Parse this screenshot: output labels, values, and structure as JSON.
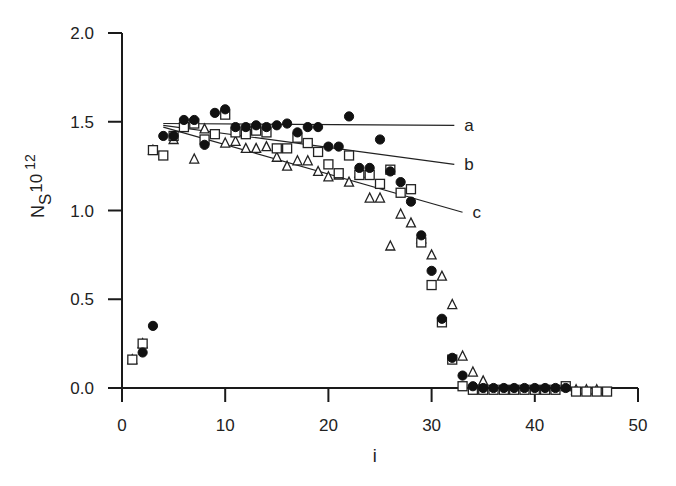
{
  "chart_data": {
    "type": "scatter",
    "title": "",
    "xlabel": "i",
    "ylabel": "N_S 10^12",
    "ylabel_parts": {
      "main": "N",
      "sub": "S",
      "mult": "10",
      "exp": "12"
    },
    "xlim": [
      0,
      50
    ],
    "ylim": [
      0.0,
      2.0
    ],
    "x_ticks": [
      0,
      10,
      20,
      30,
      40,
      50
    ],
    "x_tick_labels": [
      "0",
      "10",
      "20",
      "30",
      "40",
      "50"
    ],
    "y_ticks": [
      0.0,
      0.5,
      1.0,
      1.5,
      2.0
    ],
    "y_tick_labels": [
      "0.0",
      "0.5",
      "1.0",
      "1.5",
      "2.0"
    ],
    "grid": false,
    "legend": null,
    "series": [
      {
        "name": "filled circles",
        "marker": "circle-filled",
        "x": [
          2,
          3,
          4,
          5,
          6,
          7,
          8,
          9,
          10,
          11,
          12,
          13,
          14,
          15,
          16,
          17,
          18,
          19,
          20,
          21,
          22,
          23,
          24,
          25,
          26,
          27,
          28,
          29,
          30,
          31,
          32,
          33,
          34,
          35,
          36,
          37,
          38,
          39,
          40,
          41,
          42,
          43
        ],
        "y": [
          0.2,
          0.35,
          1.42,
          1.42,
          1.51,
          1.51,
          1.37,
          1.55,
          1.57,
          1.47,
          1.47,
          1.48,
          1.47,
          1.48,
          1.49,
          1.44,
          1.47,
          1.47,
          1.36,
          1.36,
          1.53,
          1.24,
          1.24,
          1.4,
          1.22,
          1.16,
          1.05,
          0.86,
          0.66,
          0.39,
          0.17,
          0.07,
          0.01,
          0.0,
          0.0,
          0.0,
          0.0,
          0.0,
          0.0,
          0.0,
          0.0,
          0.0
        ]
      },
      {
        "name": "open squares",
        "marker": "square-open",
        "x": [
          1,
          2,
          3,
          4,
          5,
          6,
          7,
          8,
          9,
          10,
          11,
          12,
          13,
          14,
          15,
          16,
          17,
          18,
          19,
          20,
          21,
          22,
          23,
          24,
          25,
          26,
          27,
          28,
          29,
          30,
          31,
          32,
          33,
          34,
          35,
          36,
          37,
          38,
          39,
          40,
          41,
          42,
          43,
          44,
          45,
          46,
          47
        ],
        "y": [
          0.16,
          0.25,
          1.34,
          1.31,
          1.42,
          1.47,
          1.49,
          1.4,
          1.43,
          1.54,
          1.44,
          1.43,
          1.45,
          1.44,
          1.35,
          1.35,
          1.41,
          1.38,
          1.33,
          1.26,
          1.21,
          1.31,
          1.2,
          1.2,
          1.15,
          1.23,
          1.1,
          1.12,
          0.82,
          0.58,
          0.37,
          0.16,
          0.01,
          -0.01,
          -0.01,
          -0.01,
          -0.01,
          -0.01,
          -0.01,
          -0.01,
          -0.01,
          -0.01,
          0.01,
          -0.02,
          -0.02,
          -0.02,
          -0.02
        ]
      },
      {
        "name": "open triangles",
        "marker": "triangle-open",
        "x": [
          1,
          2,
          3,
          5,
          7,
          8,
          10,
          11,
          12,
          13,
          14,
          15,
          16,
          17,
          18,
          19,
          20,
          21,
          22,
          23,
          24,
          25,
          26,
          27,
          28,
          29,
          30,
          31,
          32,
          33,
          34,
          35,
          44,
          45,
          46
        ],
        "y": [
          0.16,
          0.25,
          1.34,
          1.4,
          1.29,
          1.46,
          1.38,
          1.39,
          1.35,
          1.35,
          1.36,
          1.3,
          1.25,
          1.28,
          1.28,
          1.22,
          1.19,
          1.2,
          1.16,
          1.21,
          1.07,
          1.07,
          0.8,
          0.98,
          0.93,
          0.84,
          0.75,
          0.63,
          0.47,
          0.18,
          0.09,
          0.04,
          -0.01,
          -0.01,
          -0.01
        ]
      }
    ],
    "lines": [
      {
        "name": "a",
        "label": "a",
        "x": [
          4,
          32.2
        ],
        "y": [
          1.49,
          1.48
        ]
      },
      {
        "name": "b",
        "label": "b",
        "x": [
          4,
          32.2
        ],
        "y": [
          1.48,
          1.26
        ]
      },
      {
        "name": "c",
        "label": "c",
        "x": [
          4,
          33.0
        ],
        "y": [
          1.47,
          0.99
        ]
      }
    ]
  }
}
